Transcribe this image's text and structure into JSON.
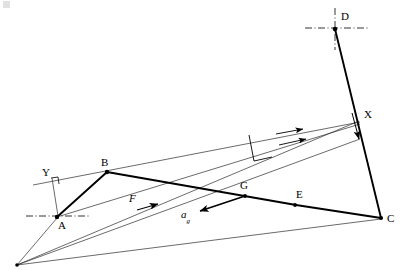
{
  "figure": {
    "type": "kinematic-linkage-velocity-diagram",
    "background_color": "#ffffff",
    "line_color": "#000000",
    "thin_line_color": "#3a3a3a",
    "width": 407,
    "height": 270
  },
  "labels": {
    "point_a": "A",
    "point_b": "B",
    "point_c": "C",
    "point_d": "D",
    "point_e": "E",
    "point_g": "G",
    "point_x": "X",
    "point_y": "Y",
    "force_f": "F",
    "accel_g_main": "a",
    "accel_g_sub": "g"
  },
  "points": {
    "A": {
      "x": 57,
      "y": 217
    },
    "B": {
      "x": 107,
      "y": 172
    },
    "C": {
      "x": 381,
      "y": 218
    },
    "D": {
      "x": 335,
      "y": 28
    },
    "E": {
      "x": 295,
      "y": 205
    },
    "G": {
      "x": 245,
      "y": 196
    },
    "X": {
      "x": 358,
      "y": 124
    },
    "Y": {
      "x": 57,
      "y": 180
    },
    "O": {
      "x": 17,
      "y": 265
    }
  },
  "markers": {
    "center_mark_a": "dash-dot-horizontal",
    "center_mark_d": "dash-dot-crosshair",
    "right_angle_y": "perpendicular-square",
    "right_angle_bx": "perpendicular-tick"
  },
  "vectors": [
    {
      "name": "F",
      "from": {
        "x": 122,
        "y": 213
      },
      "to": {
        "x": 158,
        "y": 203
      },
      "label": "F"
    },
    {
      "name": "a_g",
      "from": {
        "x": 245,
        "y": 196
      },
      "to": {
        "x": 197,
        "y": 212
      },
      "label": "a_g"
    },
    {
      "name": "v_upper",
      "from": {
        "x": 107,
        "y": 172
      },
      "to": {
        "x": 358,
        "y": 121
      },
      "label": ""
    },
    {
      "name": "v_lower",
      "from": {
        "x": 120,
        "y": 178
      },
      "to": {
        "x": 358,
        "y": 138
      },
      "label": ""
    },
    {
      "name": "v_xc",
      "from": {
        "x": 352,
        "y": 113
      },
      "to": {
        "x": 360,
        "y": 138
      },
      "label": ""
    }
  ],
  "segments": {
    "thick": [
      {
        "name": "A-B",
        "from": "A",
        "to": "B"
      },
      {
        "name": "B-E",
        "from": "B",
        "to": "E"
      },
      {
        "name": "E-C",
        "from": "E",
        "to": "C"
      },
      {
        "name": "D-C",
        "from": "D",
        "to": "C"
      },
      {
        "name": "G-arrow-stem",
        "from": "G",
        "to": "a_g"
      }
    ],
    "thin": [
      {
        "name": "O-B-X-ray",
        "from": "O",
        "to": "X"
      },
      {
        "name": "O-G-X-ray",
        "from": "O",
        "to": "X"
      },
      {
        "name": "O-C-ray",
        "from": "O",
        "to": "C"
      },
      {
        "name": "A-G-E-line",
        "from": "A",
        "to": "E"
      },
      {
        "name": "Y-line",
        "from": "Y",
        "to": "A"
      }
    ]
  }
}
